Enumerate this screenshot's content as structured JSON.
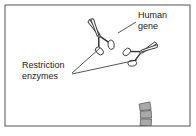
{
  "figure": {
    "background_color": "#ffffff",
    "frame": {
      "name": "figure-border",
      "color": "#555555",
      "x": 5,
      "y": 5,
      "width": 185,
      "height": 121
    }
  },
  "labels": {
    "human_gene": {
      "line1": "Human",
      "line2": "gene",
      "x": 138,
      "y": 18,
      "color": "#1a1a1a"
    },
    "restriction_enzymes": {
      "line1": "Restriction",
      "line2": "enzymes",
      "x": 22,
      "y": 68,
      "color": "#1a1a1a"
    }
  },
  "dna_ring": {
    "name": "dna-plasmid-ring",
    "center_x": 72,
    "center_y": 118,
    "radius": 74,
    "band_width": 11,
    "plain_segment_color": "#a9a9a9",
    "gene_segment_color": "#6e6e6e",
    "outline_color": "#4a4a4a",
    "segment_count": 30,
    "gene_segment_start_index": 11,
    "gene_segment_end_index": 17
  },
  "scissors": [
    {
      "name": "restriction-enzyme-scissors-left",
      "x": 99,
      "y": 36,
      "rotation_deg": -28,
      "scale": 1.0,
      "fill": "#ffffff",
      "stroke": "#333333"
    },
    {
      "name": "restriction-enzyme-scissors-right",
      "x": 141,
      "y": 52,
      "rotation_deg": 64,
      "scale": 0.95,
      "fill": "#ffffff",
      "stroke": "#333333"
    }
  ],
  "leader_lines": {
    "color": "#2a2a2a",
    "human_gene": {
      "x1": 136,
      "y1": 22,
      "x2": 118,
      "y2": 33
    },
    "enzyme_left": {
      "x1": 72,
      "y1": 73,
      "x2": 100,
      "y2": 48
    },
    "enzyme_right": {
      "x1": 72,
      "y1": 74,
      "x2": 137,
      "y2": 60
    }
  }
}
